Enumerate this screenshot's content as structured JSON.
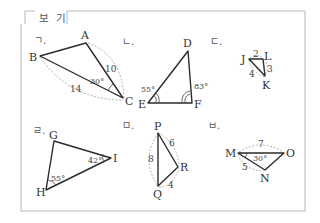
{
  "header": {
    "title": "보 기"
  },
  "panels": [
    {
      "id": "giyeok",
      "section_label": "ㄱ.",
      "vertices": {
        "A": "A",
        "B": "B",
        "C": "C"
      },
      "sides": {
        "AC": "10",
        "BC": "14"
      },
      "angles": {
        "C": "30°"
      }
    },
    {
      "id": "nieun",
      "section_label": "ㄴ.",
      "vertices": {
        "D": "D",
        "E": "E",
        "F": "F"
      },
      "angles": {
        "E": "55°",
        "F": "83°"
      }
    },
    {
      "id": "digeut",
      "section_label": "ㄷ.",
      "vertices": {
        "J": "J",
        "L": "L",
        "K": "K"
      },
      "sides": {
        "JL": "2",
        "LK": "3",
        "JK": "4"
      }
    },
    {
      "id": "rieul",
      "section_label": "ㄹ.",
      "vertices": {
        "G": "G",
        "H": "H",
        "I": "I"
      },
      "angles": {
        "I": "42°",
        "H": "55°"
      }
    },
    {
      "id": "mieum",
      "section_label": "ㅁ.",
      "vertices": {
        "P": "P",
        "Q": "Q",
        "R": "R"
      },
      "sides": {
        "PQ": "8",
        "PR": "6",
        "QR": "4"
      }
    },
    {
      "id": "bieup",
      "section_label": "ㅂ.",
      "vertices": {
        "M": "M",
        "N": "N",
        "O": "O"
      },
      "sides": {
        "MO": "7",
        "MN": "5"
      },
      "angles": {
        "M": "30°"
      }
    }
  ],
  "colors": {
    "edge": "#2b2b2b",
    "dashed_arc": "#9a9a9a",
    "box_border": "#b8b8b8",
    "text": "#333333"
  }
}
